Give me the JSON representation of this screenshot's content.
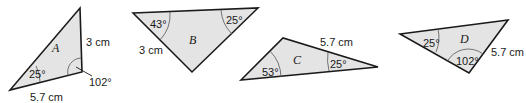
{
  "colors": {
    "fill": "#e4e4e4",
    "stroke": "#1a1a1a"
  },
  "triangles": [
    {
      "name": "A",
      "labels": {
        "side1": "3 cm",
        "side2": "5.7 cm",
        "angle1": "25°",
        "angle2": "102°"
      }
    },
    {
      "name": "B",
      "labels": {
        "side1": "3 cm",
        "angle1": "43°",
        "angle2": "25°"
      }
    },
    {
      "name": "C",
      "labels": {
        "side1": "5.7 cm",
        "angle1": "53°",
        "angle2": "25°"
      }
    },
    {
      "name": "D",
      "labels": {
        "side1": "5.7 cm",
        "angle1": "25°",
        "angle2": "102°"
      }
    }
  ]
}
